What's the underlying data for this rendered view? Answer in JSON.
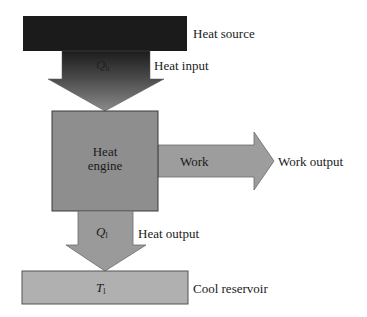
{
  "diagram": {
    "type": "heat-engine-energy-flow",
    "heat_source": {
      "label": "Heat source",
      "fill": "#1a1a1a"
    },
    "heat_input_arrow": {
      "symbol": "Q",
      "subscript": "h",
      "label": "Heat input"
    },
    "engine": {
      "line1": "Heat",
      "line2": "engine",
      "fill": "#8e8e8e"
    },
    "work_arrow": {
      "inner_label": "Work",
      "label": "Work output",
      "fill": "#9d9d9d"
    },
    "heat_output_arrow": {
      "symbol": "Q",
      "subscript": "l",
      "label": "Heat output",
      "fill": "#9a9a9a"
    },
    "cool_reservoir": {
      "symbol": "T",
      "subscript": "l",
      "label": "Cool reservoir",
      "fill": "#b0b0b0"
    }
  }
}
